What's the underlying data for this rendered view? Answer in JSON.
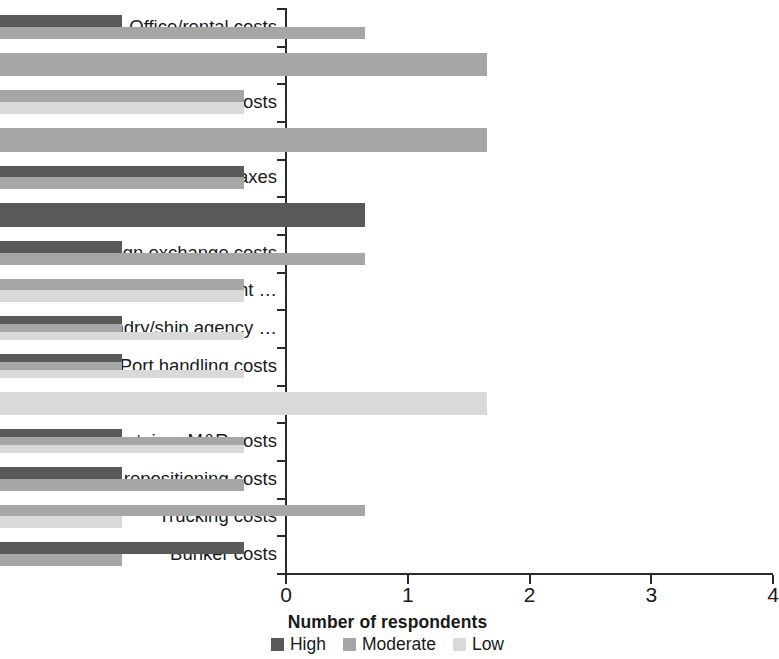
{
  "chart_data": {
    "type": "bar",
    "orientation": "horizontal",
    "stacked": true,
    "title": "",
    "xlabel": "Number of respondents",
    "ylabel": "",
    "xlim": [
      0,
      4
    ],
    "xticks": [
      "0",
      "1",
      "2",
      "3",
      "4"
    ],
    "grid": false,
    "legend_position": "bottom",
    "categories": [
      "Office/rental costs",
      "Utilities costs",
      "Staff costs",
      "Expatriate costs",
      "Taxes",
      "Borrowing costs",
      "Foreign exchange costs",
      "Cargo agency/freight …",
      "Ship husbandry/ship agency …",
      "Port handling costs",
      "Container storage/depot costs",
      "Container M&R costs",
      "Container repositioning costs",
      "Trucking costs",
      "Bunker costs"
    ],
    "series": [
      {
        "name": "High",
        "color": "#595959",
        "values": [
          1,
          0,
          0,
          0,
          2,
          3,
          1,
          0,
          1,
          1,
          0,
          1,
          1,
          0,
          2
        ]
      },
      {
        "name": "Moderate",
        "color": "#a6a6a6",
        "values": [
          3,
          4,
          2,
          4,
          2,
          0,
          3,
          2,
          1,
          1,
          0,
          2,
          2,
          3,
          1
        ]
      },
      {
        "name": "Low",
        "color": "#d9d9d9",
        "values": [
          0,
          0,
          2,
          0,
          0,
          0,
          0,
          2,
          2,
          2,
          4,
          2,
          0,
          1,
          0
        ]
      }
    ]
  },
  "axis": {
    "x_title": "Number of respondents"
  },
  "legend": {
    "items": [
      {
        "label": "High",
        "color": "#595959"
      },
      {
        "label": "Moderate",
        "color": "#a6a6a6"
      },
      {
        "label": "Low",
        "color": "#d9d9d9"
      }
    ]
  }
}
